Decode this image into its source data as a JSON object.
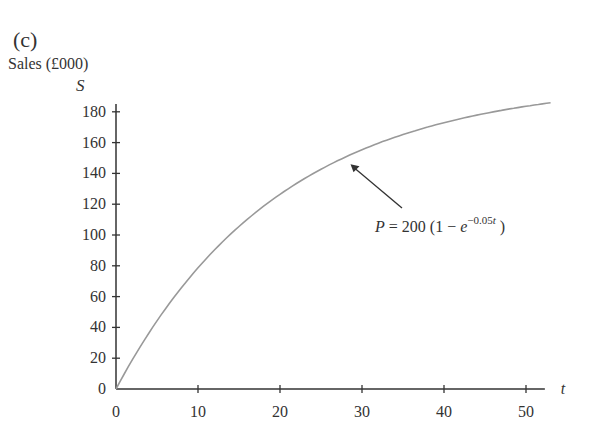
{
  "figure": {
    "panel_label": "(c)",
    "ylabel": "Sales (£000)",
    "yvar": "S",
    "xvar": "t",
    "annotation": "P = 200 (1 − e^(−0.05t))"
  },
  "chart_data": {
    "type": "line",
    "title": "",
    "panel_label": "(c)",
    "xlabel": "t",
    "ylabel": "Sales (£000), S",
    "xlim": [
      0,
      52
    ],
    "ylim": [
      0,
      185
    ],
    "xticks": [
      0,
      10,
      20,
      30,
      40,
      50
    ],
    "yticks": [
      0,
      20,
      40,
      60,
      80,
      100,
      120,
      140,
      160,
      180
    ],
    "grid": false,
    "legend": null,
    "series": [
      {
        "name": "P = 200 (1 − e^(−0.05t))",
        "formula": "200*(1-exp(-0.05*t))",
        "x": [
          0,
          5,
          10,
          15,
          20,
          25,
          30,
          35,
          40,
          45,
          50,
          53
        ],
        "values": [
          0,
          44.2,
          78.7,
          105.5,
          126.4,
          142.7,
          155.4,
          165.2,
          172.9,
          178.9,
          183.6,
          185.8
        ]
      }
    ],
    "annotations": [
      {
        "text": "P = 200 (1 − e^(−0.05t))",
        "arrow_to": {
          "t": 28,
          "S": 150
        }
      }
    ]
  }
}
